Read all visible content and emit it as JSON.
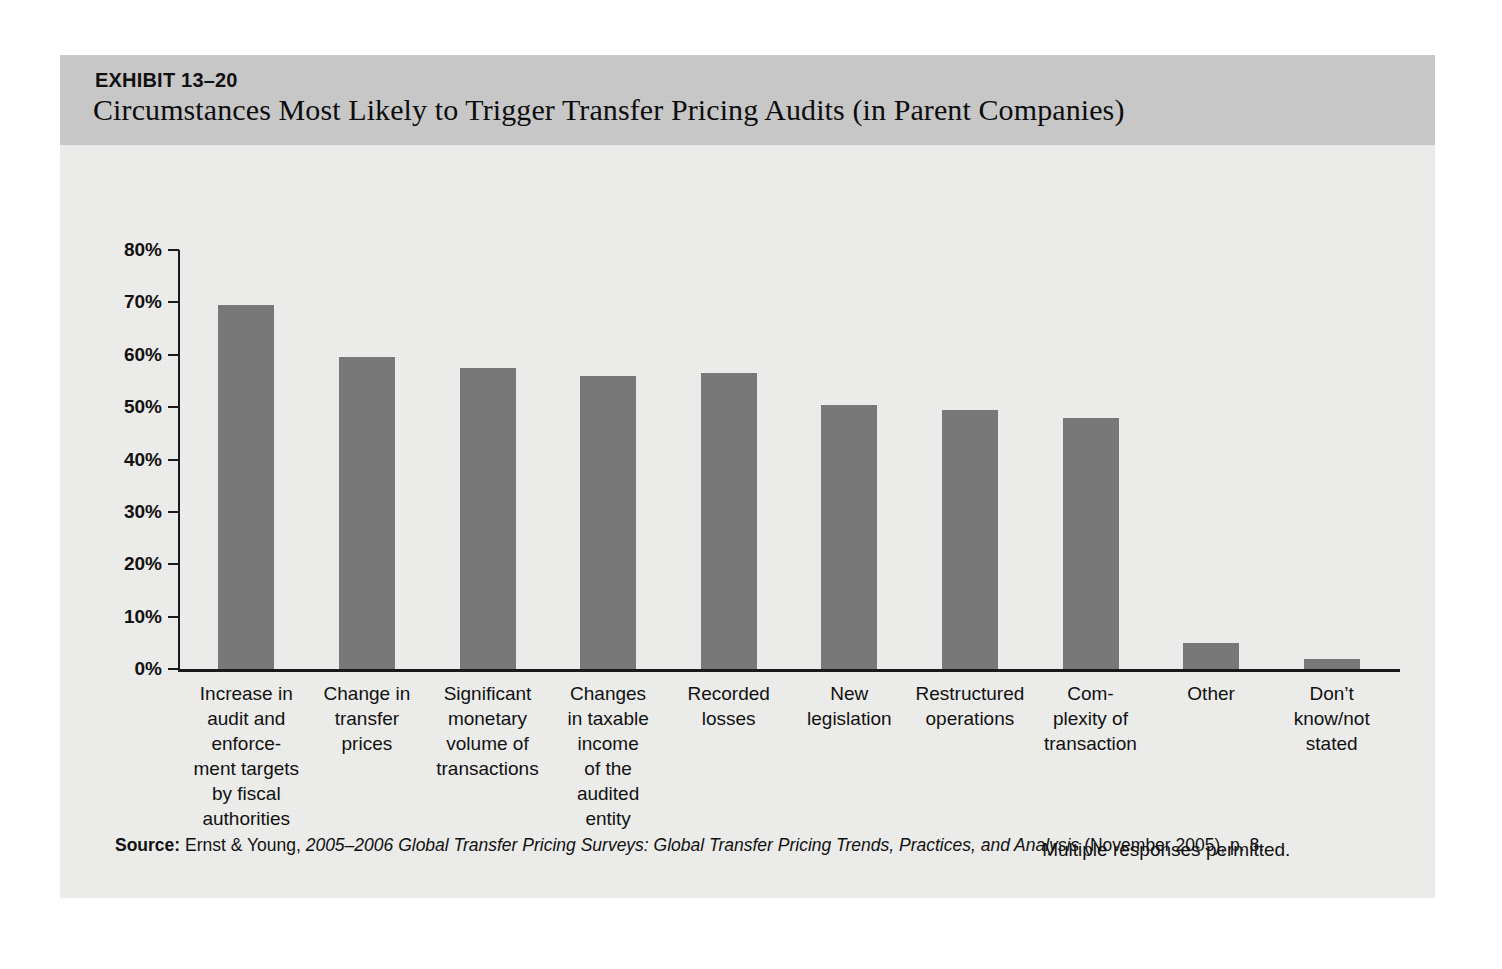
{
  "exhibit": {
    "number": "EXHIBIT 13–20",
    "title": "Circumstances Most Likely to Trigger Transfer Pricing Audits (in Parent Companies)"
  },
  "note": "Multiple responses permitted.",
  "source": {
    "label": "Source:",
    "publisher": " Ernst & Young, ",
    "work_italic": "2005–2006 Global Transfer Pricing Surveys: Global Transfer Pricing Trends, Practices, and Analysis",
    "tail": " (November 2005), p. 8."
  },
  "colors": {
    "bar": "#787878",
    "header_band": "#c9c9c9",
    "sheet": "#eeeeec",
    "axis": "#1a1a1a",
    "text": "#111111"
  },
  "chart_data": {
    "type": "bar",
    "title": "Circumstances Most Likely to Trigger Transfer Pricing Audits (in Parent Companies)",
    "xlabel": "",
    "ylabel": "",
    "ylim": [
      0,
      80
    ],
    "grid": false,
    "legend": null,
    "annotations": [
      "Multiple responses permitted."
    ],
    "ytick_labels": [
      "0%",
      "10%",
      "20%",
      "30%",
      "40%",
      "50%",
      "60%",
      "70%",
      "80%"
    ],
    "ytick_values": [
      0,
      10,
      20,
      30,
      40,
      50,
      60,
      70,
      80
    ],
    "categories": [
      "Increase in audit and enforce- ment targets by fiscal authorities",
      "Change in transfer prices",
      "Significant monetary volume of transactions",
      "Changes in taxable income of the audited entity",
      "Recorded losses",
      "New legislation",
      "Restructured operations",
      "Com- plexity of transaction",
      "Other",
      "Don’t know/not stated"
    ],
    "category_lines": [
      [
        "Increase in",
        "audit and",
        "enforce-",
        "ment targets",
        "by fiscal",
        "authorities"
      ],
      [
        "Change in",
        "transfer",
        "prices"
      ],
      [
        "Significant",
        "monetary",
        "volume of",
        "transactions"
      ],
      [
        "Changes",
        "in taxable",
        "income",
        "of the",
        "audited",
        "entity"
      ],
      [
        "Recorded",
        "losses"
      ],
      [
        "New",
        "legislation"
      ],
      [
        "Restructured",
        "operations"
      ],
      [
        "Com-",
        "plexity of",
        "transaction"
      ],
      [
        "Other"
      ],
      [
        "Don’t",
        "know/not",
        "stated"
      ]
    ],
    "values": [
      69.5,
      59.5,
      57.5,
      56.0,
      56.5,
      50.5,
      49.5,
      48.0,
      5.0,
      2.0
    ]
  }
}
